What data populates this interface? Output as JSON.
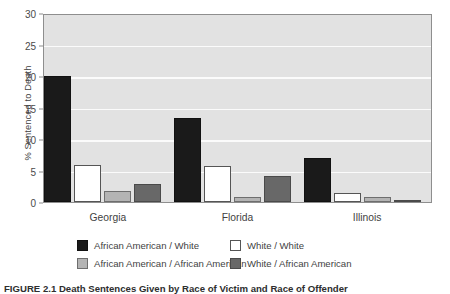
{
  "chart_data": {
    "type": "bar",
    "title": "",
    "xlabel": "",
    "ylabel": "% Sentenced to Death",
    "categories": [
      "Georgia",
      "Florida",
      "Illinois"
    ],
    "series": [
      {
        "name": "African American / White",
        "color": "#1a1a1a",
        "values": [
          20.0,
          13.3,
          7.0
        ]
      },
      {
        "name": "White / White",
        "color": "#ffffff",
        "values": [
          5.9,
          5.7,
          1.4
        ]
      },
      {
        "name": "African American / African American",
        "color": "#b4b4b4",
        "values": [
          1.7,
          0.8,
          0.8
        ]
      },
      {
        "name": "White / African American",
        "color": "#686868",
        "values": [
          2.9,
          4.1,
          0.3
        ]
      }
    ],
    "ylim": [
      0,
      30
    ],
    "yticks": [
      0,
      5,
      10,
      15,
      20,
      25,
      30
    ],
    "ytick_labels": [
      "0",
      "5",
      "10",
      "15",
      "20",
      "25",
      "30"
    ],
    "grid": true,
    "grid_axis": "y",
    "legend_position": "below-plot",
    "plot_background": "#e2e2e2",
    "gridline_color": "#fbfbfb",
    "axis_color": "#8e8e8e"
  },
  "caption": {
    "text": "FIGURE 2.1  Death Sentences Given by Race of Victim and Race of Offender"
  }
}
